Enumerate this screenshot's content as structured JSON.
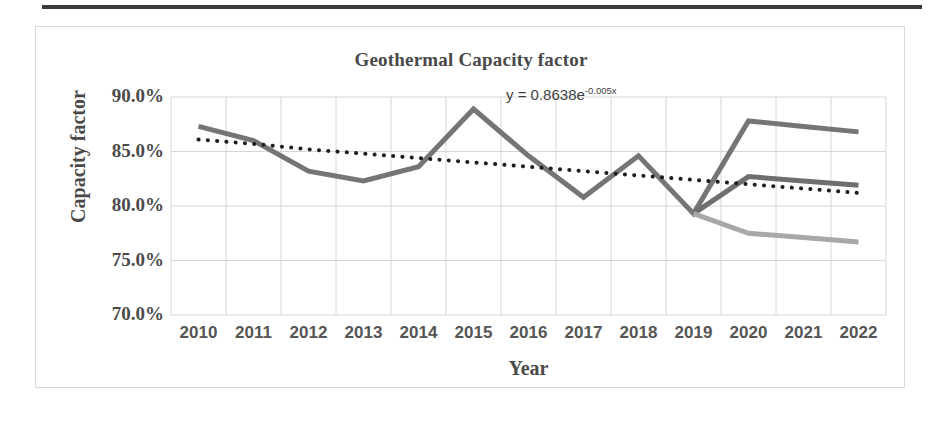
{
  "chart_data": {
    "type": "line",
    "title": "Geothermal Capacity factor",
    "xlabel": "Year",
    "ylabel": "Capacity factor",
    "categories": [
      "2010",
      "2011",
      "2012",
      "2013",
      "2014",
      "2015",
      "2016",
      "2017",
      "2018",
      "2019",
      "2020",
      "2021",
      "2022"
    ],
    "x": [
      2010,
      2011,
      2012,
      2013,
      2014,
      2015,
      2016,
      2017,
      2018,
      2019,
      2020,
      2021,
      2022
    ],
    "ylim": [
      70.0,
      90.0
    ],
    "y_ticks": [
      "90.0%",
      "85.0%",
      "80.0%",
      "75.0%",
      "70.0%"
    ],
    "y_tick_values": [
      90.0,
      85.0,
      80.0,
      75.0,
      70.0
    ],
    "grid": true,
    "legend": "none",
    "series": [
      {
        "name": "historical-and-high-case",
        "color": "#757575",
        "style": "solid",
        "width": 5,
        "values": [
          87.3,
          86.0,
          83.2,
          82.3,
          83.6,
          88.9,
          84.6,
          80.8,
          84.6,
          79.3,
          87.8,
          87.3,
          86.8
        ]
      },
      {
        "name": "mid-case",
        "color": "#6e6e6e",
        "style": "solid",
        "width": 5,
        "values": [
          null,
          null,
          null,
          null,
          null,
          null,
          null,
          null,
          null,
          79.3,
          82.7,
          82.3,
          81.9
        ]
      },
      {
        "name": "low-case",
        "color": "#a8a8a8",
        "style": "solid",
        "width": 5,
        "values": [
          null,
          null,
          null,
          null,
          null,
          null,
          null,
          null,
          null,
          79.3,
          77.5,
          77.1,
          76.7
        ]
      },
      {
        "name": "exponential-trendline",
        "color": "#1f1f1f",
        "style": "dotted",
        "width": 4,
        "values": [
          86.1,
          85.7,
          85.2,
          84.8,
          84.4,
          84.0,
          83.6,
          83.2,
          82.8,
          82.4,
          82.0,
          81.6,
          81.2
        ]
      }
    ],
    "annotations": [
      {
        "name": "trendline-equation",
        "text_main": "y = 0.8638e",
        "text_exponent": "-0.005x"
      }
    ]
  }
}
